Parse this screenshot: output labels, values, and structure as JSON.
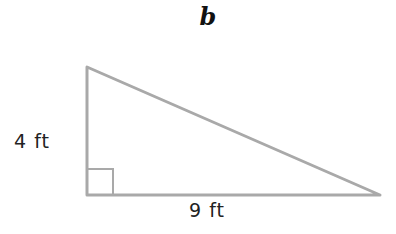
{
  "diagram": {
    "label": "b",
    "shape": "right-triangle",
    "stroke_color": "#a9a9a9",
    "vertices": {
      "top": [
        87,
        67
      ],
      "right_angle": [
        87,
        195
      ],
      "right": [
        380,
        195
      ]
    },
    "sides": {
      "vertical_leg": "4 ft",
      "horizontal_leg": "9 ft"
    },
    "right_angle_marker": true
  }
}
